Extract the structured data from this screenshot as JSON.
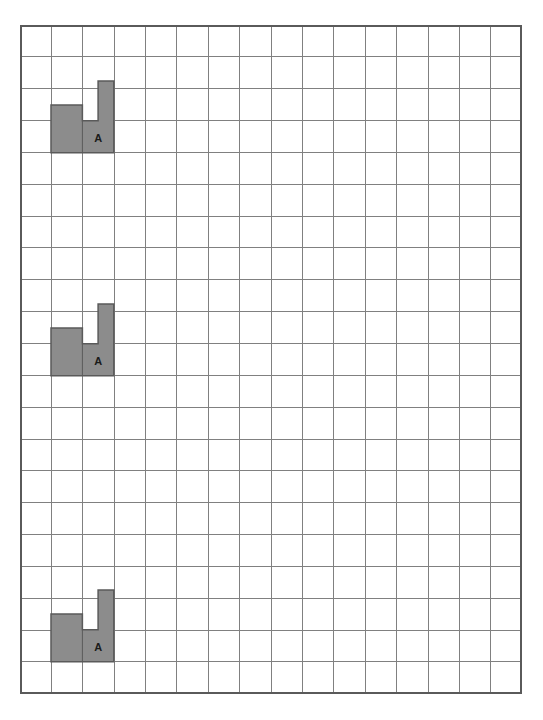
{
  "canvas": {
    "width": 543,
    "height": 720,
    "background": "#ffffff"
  },
  "grid": {
    "origin_x": 20,
    "origin_y": 25,
    "columns": 16,
    "rows": 21,
    "cell_width": 31.4,
    "cell_height": 31.85,
    "line_color": "#808080",
    "line_width": 1,
    "border_color": "#5a5a5a",
    "border_width": 2
  },
  "shape_style": {
    "fill_color": "#8c8c8c",
    "stroke_color": "#5a5a5a",
    "stroke_width": 1.5,
    "label_color": "#1a1a1a"
  },
  "shapes": [
    {
      "name": "shape-1",
      "label": "A",
      "base_col": 2,
      "base_row": 4,
      "base_cols": 2,
      "base_rows": 1,
      "left_block": {
        "col": 2,
        "cols": 1,
        "height_cells": 0.5
      },
      "tall_block": {
        "col": 3,
        "x_offset_cells": 0.5,
        "cols": 0.5,
        "height_cells": 1.25
      },
      "label_cell_col": 3,
      "label_cell_row": 4
    },
    {
      "name": "shape-2",
      "label": "A",
      "base_col": 2,
      "base_row": 11,
      "base_cols": 2,
      "base_rows": 1,
      "left_block": {
        "col": 2,
        "cols": 1,
        "height_cells": 0.5
      },
      "tall_block": {
        "col": 3,
        "x_offset_cells": 0.5,
        "cols": 0.5,
        "height_cells": 1.25
      },
      "label_cell_col": 3,
      "label_cell_row": 11
    },
    {
      "name": "shape-3",
      "label": "A",
      "base_col": 2,
      "base_row": 20,
      "base_cols": 2,
      "base_rows": 1,
      "left_block": {
        "col": 2,
        "cols": 1,
        "height_cells": 0.5
      },
      "tall_block": {
        "col": 3,
        "x_offset_cells": 0.5,
        "cols": 0.5,
        "height_cells": 1.25
      },
      "label_cell_col": 3,
      "label_cell_row": 20
    }
  ]
}
